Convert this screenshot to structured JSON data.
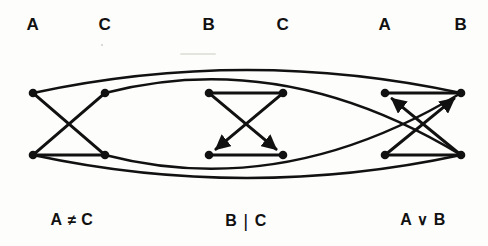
{
  "figure": {
    "type": "diagram",
    "subtype": "constraint-graph",
    "background_color": "#fdfdfb",
    "ink_color": "#111111",
    "width": 488,
    "height": 246
  },
  "top_labels": [
    {
      "text": "A",
      "x": 33,
      "y": 25
    },
    {
      "text": "C",
      "x": 105,
      "y": 25
    },
    {
      "text": "B",
      "x": 209,
      "y": 25
    },
    {
      "text": "C",
      "x": 283,
      "y": 25
    },
    {
      "text": "A",
      "x": 385,
      "y": 25
    },
    {
      "text": "B",
      "x": 461,
      "y": 25
    }
  ],
  "bottom_labels": [
    {
      "id": "constraint-1",
      "left": "A",
      "operator": "≠",
      "right": "C",
      "x": 72,
      "y": 220
    },
    {
      "id": "constraint-2",
      "left": "B",
      "operator": "|",
      "right": "C",
      "x": 246,
      "y": 220
    },
    {
      "id": "constraint-3",
      "left": "A",
      "operator": "∨",
      "right": "B",
      "x": 423,
      "y": 220
    }
  ],
  "nodes": [
    {
      "id": "n1",
      "group": 1,
      "x": 33,
      "y": 93,
      "label": "A"
    },
    {
      "id": "n2",
      "group": 1,
      "x": 105,
      "y": 93,
      "label": "C"
    },
    {
      "id": "n3",
      "group": 1,
      "x": 33,
      "y": 155,
      "label": "A"
    },
    {
      "id": "n4",
      "group": 1,
      "x": 105,
      "y": 155,
      "label": "C"
    },
    {
      "id": "n5",
      "group": 2,
      "x": 209,
      "y": 93,
      "label": "B"
    },
    {
      "id": "n6",
      "group": 2,
      "x": 283,
      "y": 93,
      "label": "C"
    },
    {
      "id": "n7",
      "group": 2,
      "x": 209,
      "y": 155,
      "label": "B"
    },
    {
      "id": "n8",
      "group": 2,
      "x": 283,
      "y": 155,
      "label": "C"
    },
    {
      "id": "n9",
      "group": 3,
      "x": 385,
      "y": 93,
      "label": "A"
    },
    {
      "id": "n10",
      "group": 3,
      "x": 461,
      "y": 93,
      "label": "B"
    },
    {
      "id": "n11",
      "group": 3,
      "x": 385,
      "y": 155,
      "label": "A"
    },
    {
      "id": "n12",
      "group": 3,
      "x": 461,
      "y": 155,
      "label": "B"
    }
  ],
  "edges": [
    {
      "id": "e1",
      "from": "n1",
      "to": "n4",
      "kind": "straight",
      "directed": false
    },
    {
      "id": "e2",
      "from": "n2",
      "to": "n3",
      "kind": "straight",
      "directed": false
    },
    {
      "id": "e3",
      "from": "n3",
      "to": "n4",
      "kind": "straight",
      "directed": false
    },
    {
      "id": "e4",
      "from": "n5",
      "to": "n8",
      "kind": "straight",
      "directed": true
    },
    {
      "id": "e5",
      "from": "n6",
      "to": "n7",
      "kind": "straight",
      "directed": true
    },
    {
      "id": "e6",
      "from": "n5",
      "to": "n6",
      "kind": "straight",
      "directed": false
    },
    {
      "id": "e7",
      "from": "n7",
      "to": "n8",
      "kind": "straight",
      "directed": false
    },
    {
      "id": "e8",
      "from": "n11",
      "to": "n10",
      "kind": "straight",
      "directed": true
    },
    {
      "id": "e9",
      "from": "n12",
      "to": "n9",
      "kind": "straight",
      "directed": true
    },
    {
      "id": "e10",
      "from": "n9",
      "to": "n10",
      "kind": "straight",
      "directed": false
    },
    {
      "id": "e11",
      "from": "n11",
      "to": "n12",
      "kind": "straight",
      "directed": false
    },
    {
      "id": "e12",
      "from": "n1",
      "to": "n10",
      "kind": "arc-top",
      "directed": false
    },
    {
      "id": "e13",
      "from": "n2",
      "to": "n12",
      "kind": "arc-top",
      "directed": false
    },
    {
      "id": "e14",
      "from": "n3",
      "to": "n12",
      "kind": "arc-bottom",
      "directed": false
    },
    {
      "id": "e15",
      "from": "n4",
      "to": "n10",
      "kind": "arc-bottom",
      "directed": false
    }
  ]
}
